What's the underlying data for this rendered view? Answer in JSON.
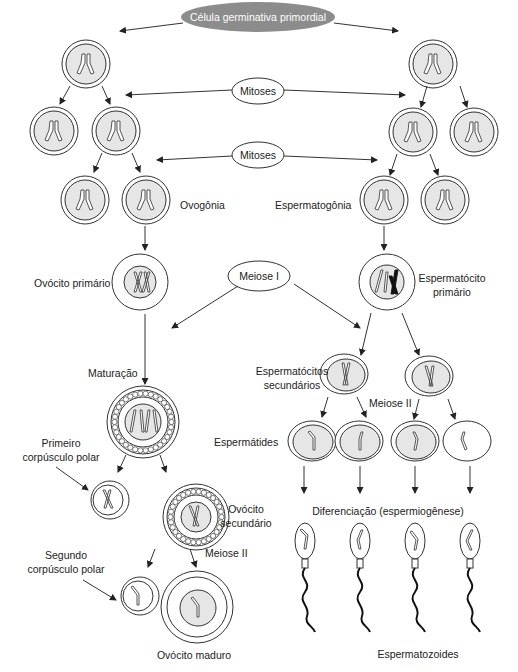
{
  "diagram": {
    "root": {
      "label": "Célula germinativa primordial",
      "fill": "#8c8c8c"
    },
    "process_ovals": {
      "mitoses_1": "Mitoses",
      "mitoses_2": "Mitoses",
      "meiose_1": "Meiose I"
    },
    "female": {
      "ovogonia": "Ovogônia",
      "ovocito_primario": "Ovócito primário",
      "maturacao": "Maturação",
      "primeiro_corpusculo_line1": "Primeiro",
      "primeiro_corpusculo_line2": "corpúsculo polar",
      "ovocito_secundario_line1": "Ovócito",
      "ovocito_secundario_line2": "secundário",
      "meiose_2": "Meiose II",
      "segundo_corpusculo_line1": "Segundo",
      "segundo_corpusculo_line2": "corpúsculo polar",
      "ovocito_maduro": "Ovócito maduro"
    },
    "male": {
      "espermatogonia": "Espermatogônia",
      "espermatocito_primario_line1": "Espermatócito",
      "espermatocito_primario_line2": "primário",
      "espermatocitos_secundarios_line1": "Espermatócitos",
      "espermatocitos_secundarios_line2": "secundários",
      "meiose_2": "Meiose II",
      "espermatides": "Espermátides",
      "diferenciacao": "Diferenciação (espermiogênese)",
      "espermatozoides": "Espermatozoides"
    },
    "colors": {
      "root_oval": "#8c8c8c",
      "cell_nucleus": "#e6e6e6",
      "outline": "#333333",
      "dark_chromosome": "#111111"
    }
  }
}
